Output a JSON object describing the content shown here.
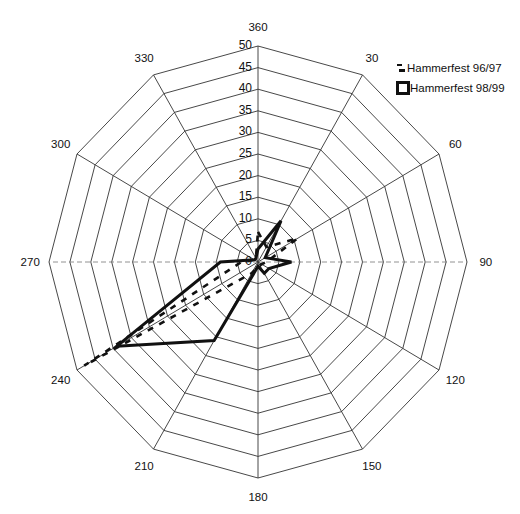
{
  "chart_data": {
    "type": "radar",
    "title": "",
    "angles": [
      360,
      30,
      60,
      90,
      120,
      150,
      180,
      210,
      240,
      270,
      300,
      330
    ],
    "angle_labels": [
      "360",
      "30",
      "60",
      "90",
      "120",
      "150",
      "180",
      "210",
      "240",
      "270",
      "300",
      "330"
    ],
    "radial_ticks": [
      0,
      5,
      10,
      15,
      20,
      25,
      30,
      35,
      40,
      45,
      50
    ],
    "radial_tick_labels": [
      "0",
      "5",
      "10",
      "15",
      "20",
      "25",
      "30",
      "35",
      "40",
      "45",
      "50"
    ],
    "rlim": [
      0,
      50
    ],
    "grid": true,
    "legend_position": "top-right",
    "series": [
      {
        "name": "Hammerfest 96/97",
        "style": "dashed",
        "values": [
          7,
          4,
          11,
          2,
          1,
          1,
          1,
          3,
          48,
          4,
          1,
          1
        ]
      },
      {
        "name": "Hammerfest 98/99",
        "style": "solid",
        "values": [
          3,
          11,
          2,
          8,
          3,
          3,
          1,
          21,
          39,
          9,
          1,
          1
        ]
      }
    ]
  },
  "legend": {
    "items": [
      {
        "label": "Hammerfest 96/97",
        "marker": "dash"
      },
      {
        "label": "Hammerfest 98/99",
        "marker": "box"
      }
    ]
  }
}
